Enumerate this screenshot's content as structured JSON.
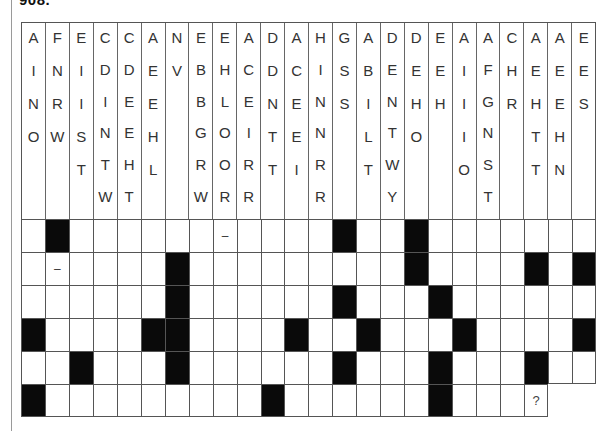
{
  "header": {
    "label": "908."
  },
  "clue_columns": [
    [
      "A",
      "I",
      "N",
      "O"
    ],
    [
      "F",
      "N",
      "R",
      "W"
    ],
    [
      "E",
      "I",
      "I",
      "S",
      "T"
    ],
    [
      "C",
      "D",
      "I",
      "N",
      "T",
      "W"
    ],
    [
      "C",
      "D",
      "E",
      "E",
      "H",
      "T"
    ],
    [
      "A",
      "E",
      "E",
      "H",
      "L"
    ],
    [
      "N",
      "V"
    ],
    [
      "E",
      "B",
      "B",
      "G",
      "R",
      "W"
    ],
    [
      "E",
      "H",
      "L",
      "O",
      "O",
      "R"
    ],
    [
      "A",
      "C",
      "E",
      "I",
      "R",
      "R"
    ],
    [
      "D",
      "D",
      "N",
      "T",
      "T"
    ],
    [
      "A",
      "C",
      "E",
      "E",
      "I"
    ],
    [
      "H",
      "I",
      "N",
      "N",
      "R",
      "R"
    ],
    [
      "G",
      "S",
      "S"
    ],
    [
      "A",
      "B",
      "I",
      "L",
      "T"
    ],
    [
      "D",
      "E",
      "N",
      "T",
      "W",
      "Y"
    ],
    [
      "D",
      "E",
      "H",
      "O"
    ],
    [
      "E",
      "E",
      "H"
    ],
    [
      "A",
      "I",
      "I",
      "I",
      "O"
    ],
    [
      "A",
      "F",
      "G",
      "N",
      "S",
      "T"
    ],
    [
      "C",
      "H",
      "R"
    ],
    [
      "A",
      "E",
      "H",
      "T",
      "T"
    ],
    [
      "A",
      "E",
      "E",
      "H",
      "N"
    ],
    [
      "E",
      "E",
      "S"
    ]
  ],
  "grid": {
    "columns": 24,
    "rows": [
      {
        "length": 24,
        "black": [
          2,
          14,
          17
        ],
        "marks": {
          "9": "–"
        }
      },
      {
        "length": 24,
        "black": [
          7,
          17,
          22,
          24
        ],
        "marks": {
          "2": "–"
        }
      },
      {
        "length": 24,
        "black": [
          7,
          14,
          18
        ],
        "marks": {}
      },
      {
        "length": 24,
        "black": [
          1,
          6,
          7,
          12,
          15,
          19,
          24
        ],
        "marks": {}
      },
      {
        "length": 24,
        "black": [
          3,
          7,
          14,
          18,
          22
        ],
        "marks": {}
      },
      {
        "length": 22,
        "black": [
          1,
          11,
          18
        ],
        "marks": {
          "22": "?"
        }
      }
    ]
  },
  "colors": {
    "black_cell": "#0a0a0a",
    "grid_line": "#555555",
    "background": "#ffffff"
  }
}
